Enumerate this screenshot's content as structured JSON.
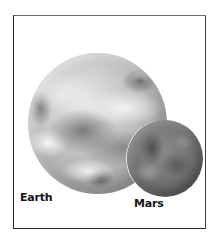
{
  "figure": {
    "title": "",
    "planets": [
      {
        "name": "Earth",
        "label": "Earth",
        "tone": "#bdbdbd"
      },
      {
        "name": "Mars",
        "label": "Mars",
        "tone": "#707070"
      }
    ]
  },
  "colors": {
    "background": "#ffffff",
    "frame_border": "#2a2a2a",
    "label_text": "#111111"
  }
}
